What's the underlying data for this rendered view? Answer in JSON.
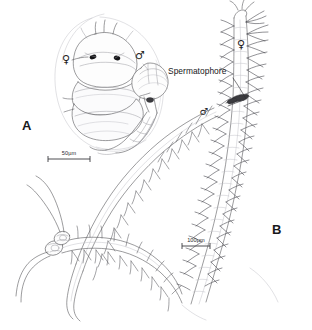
{
  "figure": {
    "type": "scientific-line-drawing",
    "background_color": "#ffffff",
    "ink_color": "#5e5e62",
    "accent_dark": "#3a3a3e"
  },
  "panels": [
    {
      "id": "A",
      "letter": "A",
      "letter_pos": {
        "x": 22,
        "y": 130
      },
      "description": "Close-up of female anterior end with attached dwarf male",
      "symbols": [
        {
          "name": "female-symbol",
          "glyph": "♀",
          "x": 66,
          "y": 63
        },
        {
          "name": "male-symbol",
          "glyph": "♂",
          "x": 140,
          "y": 59
        }
      ],
      "scale_bar": {
        "label": "50µm",
        "value": 50,
        "unit": "µm",
        "x": 48,
        "y": 158,
        "length_px": 42
      }
    },
    {
      "id": "B",
      "letter": "B",
      "letter_pos": {
        "x": 272,
        "y": 234
      },
      "description": "Whole female worm with chaetae and attached dwarf male bearing spermatophore",
      "symbols": [
        {
          "name": "female-symbol",
          "glyph": "♀",
          "x": 241,
          "y": 48
        },
        {
          "name": "male-symbol",
          "glyph": "♂",
          "x": 204,
          "y": 115
        }
      ],
      "scale_bar": {
        "label": "100µm",
        "value": 100,
        "unit": "µm",
        "x": 182,
        "y": 245,
        "length_px": 28
      }
    }
  ],
  "annotations": [
    {
      "name": "spermatophore-label",
      "text": "Spermatophore",
      "x": 168,
      "y": 74,
      "leader_from": {
        "x": 233,
        "y": 78
      },
      "leader_to": {
        "x": 246,
        "y": 99
      }
    }
  ],
  "caption": {
    "cropped_text": ""
  }
}
